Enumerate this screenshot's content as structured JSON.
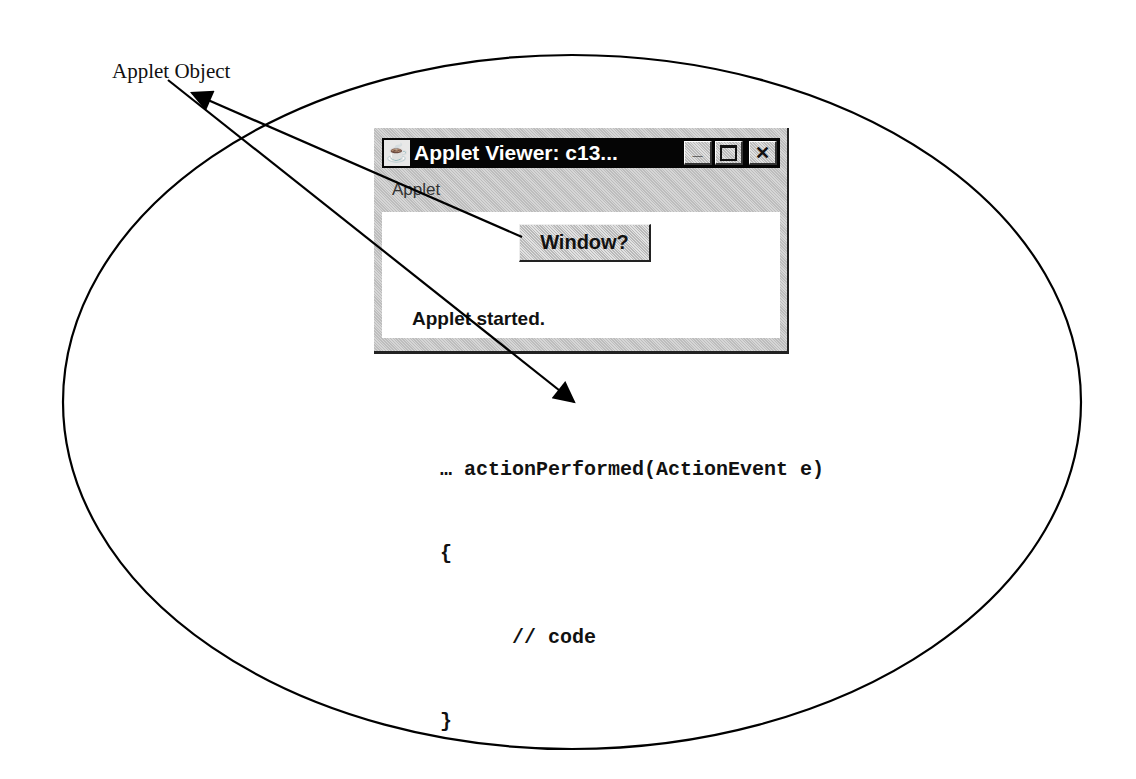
{
  "diagram": {
    "label": "Applet Object",
    "ellipse": {
      "cx": 572,
      "cy": 402,
      "rx": 509,
      "ry": 347,
      "stroke": "#000000"
    },
    "arrows": [
      {
        "name": "button-to-applet-object",
        "from": [
          522,
          237
        ],
        "to": [
          192,
          93
        ]
      },
      {
        "name": "applet-object-to-action-performed",
        "from": [
          168,
          80
        ],
        "to": [
          574,
          402
        ]
      }
    ]
  },
  "applet_window": {
    "title": "Applet Viewer: c13...",
    "app_icon": "☕",
    "controls": {
      "minimize": "_",
      "maximize": "□",
      "close": "✕"
    },
    "menu": {
      "items": [
        {
          "label": "Applet"
        }
      ]
    },
    "button": {
      "label": "Window?"
    },
    "status": "Applet started."
  },
  "code": {
    "lines": [
      "… actionPerformed(ActionEvent e)",
      "{",
      "      // code",
      "}"
    ]
  }
}
